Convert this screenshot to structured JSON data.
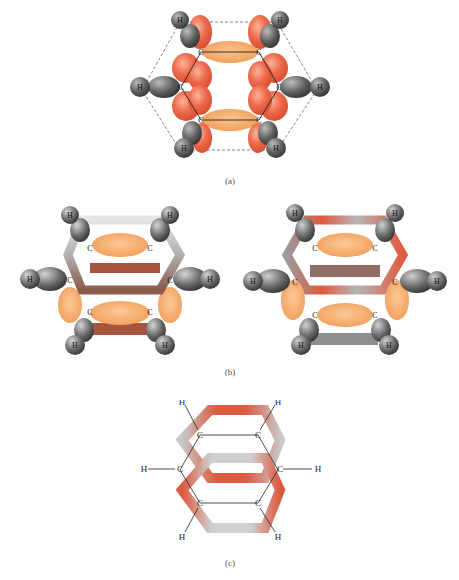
{
  "figure": {
    "panels": [
      {
        "id": "a",
        "caption": "(a)",
        "description": "Benzene sigma framework with p orbitals (top view)"
      },
      {
        "id": "b",
        "caption": "(b)",
        "description": "Two pi orbital overlap views"
      },
      {
        "id": "c",
        "caption": "(c)",
        "description": "Delocalized pi electron cloud rings above and below plane"
      }
    ],
    "atom_labels": {
      "carbon": "C",
      "hydrogen": "H"
    },
    "colors": {
      "p_orbital": "#e8553a",
      "sigma_bond": "#f3a35a",
      "hydrogen": "#5a5a5a",
      "ring_gray": "#b8b8b8",
      "ring_red": "#dc5a3f",
      "dashed": "#666666"
    }
  }
}
